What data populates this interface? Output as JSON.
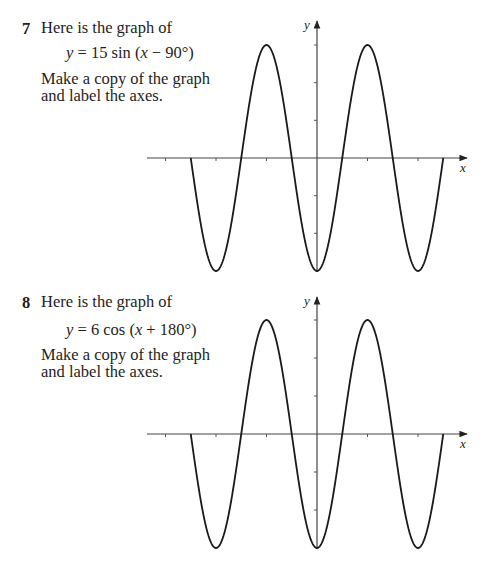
{
  "questions": [
    {
      "number": "7",
      "intro": "Here is the graph of",
      "formula": {
        "lhs": "y",
        "eq": " = 15 sin (",
        "var": "x",
        "rest": " − 90°)"
      },
      "instruction_line1": "Make a copy of the graph",
      "instruction_line2": "and label the axes.",
      "axis_labels": {
        "x": "x",
        "y": "y"
      }
    },
    {
      "number": "8",
      "intro": "Here is the graph of",
      "formula": {
        "lhs": "y",
        "eq": " = 6 cos (",
        "var": "x",
        "rest": " + 180°)"
      },
      "instruction_line1": "Make a copy of the graph",
      "instruction_line2": "and label the axes.",
      "axis_labels": {
        "x": "x",
        "y": "y"
      }
    }
  ],
  "chart_data": [
    {
      "type": "line",
      "title": "y = 15 sin (x − 90°)",
      "xlabel": "x",
      "ylabel": "y",
      "x_ticks_deg": [
        -540,
        -360,
        -180,
        0,
        180,
        360,
        540
      ],
      "y_ticks": [
        -10,
        -5,
        0,
        5,
        10,
        15
      ],
      "tick_labels_shown": false,
      "amplitude": 15,
      "period_deg": 360,
      "xlim": [
        -450,
        450
      ],
      "ylim": [
        -15,
        15
      ],
      "x": [
        -450,
        -360,
        -180,
        0,
        180,
        360,
        450
      ],
      "y": [
        0,
        -15,
        15,
        -15,
        15,
        -15,
        0
      ],
      "grid": false
    },
    {
      "type": "line",
      "title": "y = 6 cos (x + 180°)",
      "xlabel": "x",
      "ylabel": "y",
      "x_ticks_deg": [
        -540,
        -360,
        -180,
        0,
        180,
        360,
        540
      ],
      "y_ticks": [
        -4,
        -2,
        0,
        2,
        4,
        6
      ],
      "tick_labels_shown": false,
      "amplitude": 6,
      "period_deg": 360,
      "xlim": [
        -450,
        450
      ],
      "ylim": [
        -6,
        6
      ],
      "x": [
        -450,
        -360,
        -180,
        0,
        180,
        360,
        450
      ],
      "y": [
        0,
        -6,
        6,
        -6,
        6,
        -6,
        0
      ],
      "grid": false
    }
  ]
}
